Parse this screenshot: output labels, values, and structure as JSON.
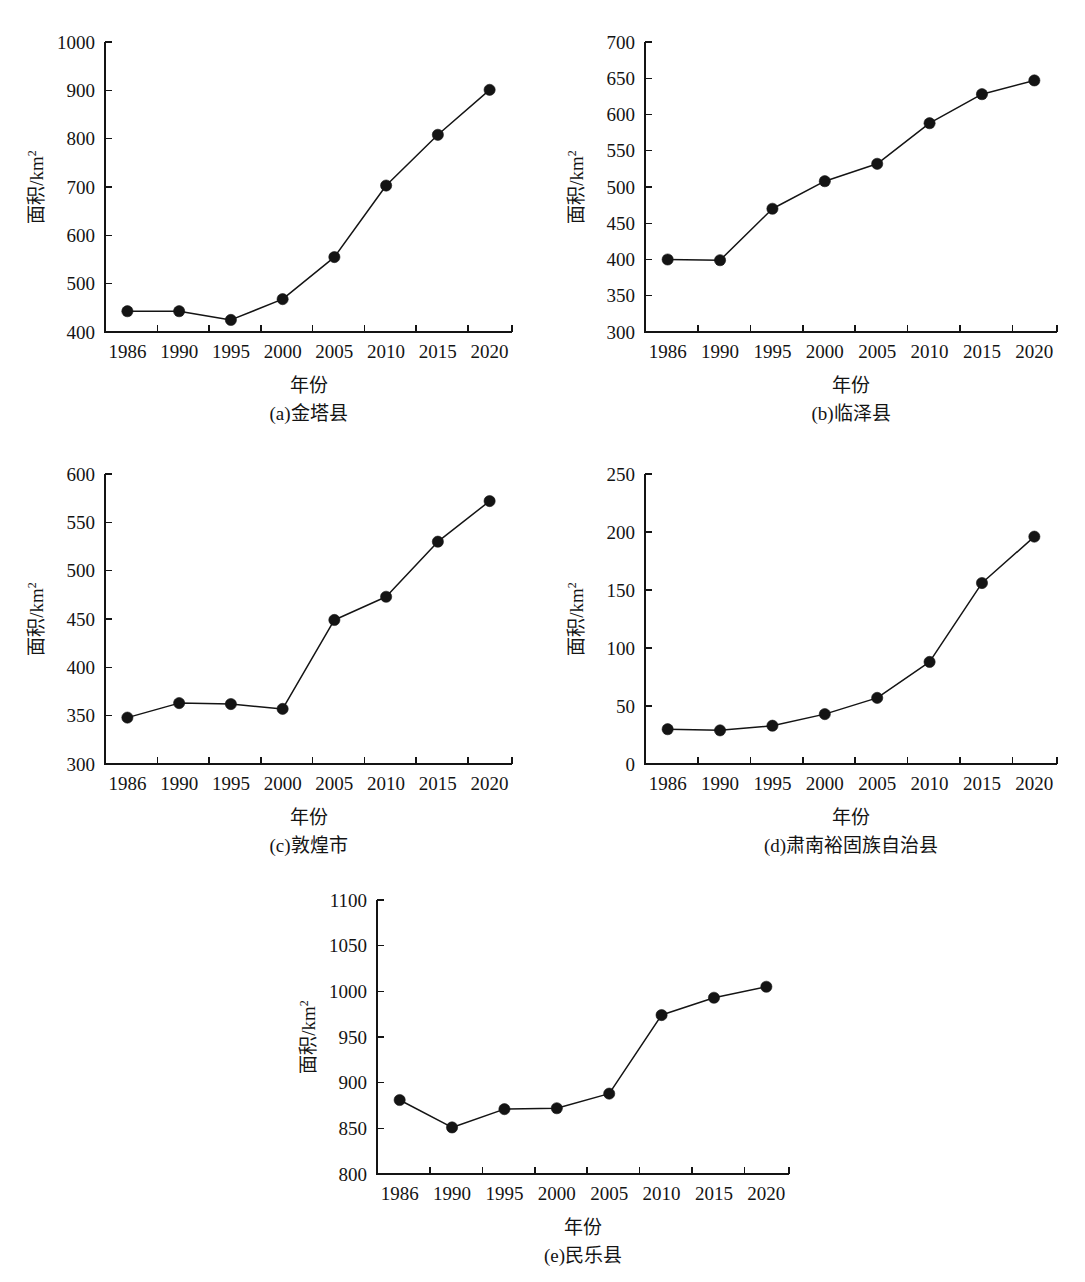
{
  "figure": {
    "xlabel": "年份",
    "ylabel_main": "面积/km",
    "ylabel_sup": "2",
    "years": [
      "1986",
      "1990",
      "1995",
      "2000",
      "2005",
      "2010",
      "2015",
      "2020"
    ]
  },
  "chart_data": [
    {
      "id": "panel-a",
      "type": "line",
      "title": "(a)金塔县",
      "xlabel": "年份",
      "ylabel": "面积/km2",
      "categories": [
        "1986",
        "1990",
        "1995",
        "2000",
        "2005",
        "2010",
        "2015",
        "2020"
      ],
      "values": [
        443,
        443,
        425,
        468,
        555,
        703,
        808,
        901
      ],
      "ylim": [
        400,
        1000
      ],
      "yticks": [
        400,
        500,
        600,
        700,
        800,
        900,
        1000
      ],
      "grid": false,
      "legend": "none"
    },
    {
      "id": "panel-b",
      "type": "line",
      "title": "(b)临泽县",
      "xlabel": "年份",
      "ylabel": "面积/km2",
      "categories": [
        "1986",
        "1990",
        "1995",
        "2000",
        "2005",
        "2010",
        "2015",
        "2020"
      ],
      "values": [
        400,
        399,
        470,
        508,
        532,
        588,
        628,
        647
      ],
      "ylim": [
        300,
        700
      ],
      "yticks": [
        300,
        350,
        400,
        450,
        500,
        550,
        600,
        650,
        700
      ],
      "grid": false,
      "legend": "none"
    },
    {
      "id": "panel-c",
      "type": "line",
      "title": "(c)敦煌市",
      "xlabel": "年份",
      "ylabel": "面积/km2",
      "categories": [
        "1986",
        "1990",
        "1995",
        "2000",
        "2005",
        "2010",
        "2015",
        "2020"
      ],
      "values": [
        348,
        363,
        362,
        357,
        449,
        473,
        530,
        572
      ],
      "ylim": [
        300,
        600
      ],
      "yticks": [
        300,
        350,
        400,
        450,
        500,
        550,
        600
      ],
      "grid": false,
      "legend": "none"
    },
    {
      "id": "panel-d",
      "type": "line",
      "title": "(d)肃南裕固族自治县",
      "xlabel": "年份",
      "ylabel": "面积/km2",
      "categories": [
        "1986",
        "1990",
        "1995",
        "2000",
        "2005",
        "2010",
        "2015",
        "2020"
      ],
      "values": [
        30,
        29,
        33,
        43,
        57,
        88,
        156,
        196
      ],
      "ylim": [
        0,
        250
      ],
      "yticks": [
        0,
        50,
        100,
        150,
        200,
        250
      ],
      "grid": false,
      "legend": "none"
    },
    {
      "id": "panel-e",
      "type": "line",
      "title": "(e)民乐县",
      "xlabel": "年份",
      "ylabel": "面积/km2",
      "categories": [
        "1986",
        "1990",
        "1995",
        "2000",
        "2005",
        "2010",
        "2015",
        "2020"
      ],
      "values": [
        881,
        851,
        871,
        872,
        888,
        974,
        993,
        1005
      ],
      "ylim": [
        800,
        1100
      ],
      "yticks": [
        800,
        850,
        900,
        950,
        1000,
        1050,
        1100
      ],
      "grid": false,
      "legend": "none"
    }
  ],
  "layout": {
    "panels": [
      {
        "id": "panel-a",
        "left": 0,
        "top": 8,
        "width": 540,
        "height": 432
      },
      {
        "id": "panel-b",
        "left": 540,
        "top": 8,
        "width": 545,
        "height": 432
      },
      {
        "id": "panel-c",
        "left": 0,
        "top": 440,
        "width": 540,
        "height": 432
      },
      {
        "id": "panel-d",
        "left": 540,
        "top": 440,
        "width": 545,
        "height": 432
      },
      {
        "id": "panel-e",
        "left": 272,
        "top": 866,
        "width": 545,
        "height": 416
      }
    ]
  }
}
